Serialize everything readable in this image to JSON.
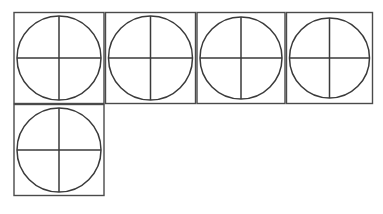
{
  "figure": {
    "title": "Quartered circles in squares",
    "background_color": "#ffffff",
    "square_stroke_color": "#4a4a4a",
    "circle_stroke_color": "#3a3a3a",
    "divider_stroke_color": "#3a3a3a",
    "stroke_width": 1.5,
    "shape_count": 5,
    "parts_per_shape": 4,
    "total_parts": 20,
    "rows": [
      {
        "row_label": "top-row",
        "cell_count": 4
      },
      {
        "row_label": "bottom-row",
        "cell_count": 1
      }
    ],
    "cells": [
      {
        "id": "cell-1",
        "label": "Quartered circle 1",
        "row": "top-row",
        "column": 1,
        "x": 14,
        "y": 12.5,
        "width": 90,
        "height": 91,
        "circle_cx": 59,
        "circle_cy": 58,
        "circle_r": 42
      },
      {
        "id": "cell-2",
        "label": "Quartered circle 2",
        "row": "top-row",
        "column": 2,
        "x": 105.5,
        "y": 12.5,
        "width": 90,
        "height": 91,
        "circle_cx": 150.5,
        "circle_cy": 58,
        "circle_r": 42
      },
      {
        "id": "cell-3",
        "label": "Quartered circle 3",
        "row": "top-row",
        "column": 3,
        "x": 197,
        "y": 12.5,
        "width": 88,
        "height": 91,
        "circle_cx": 241,
        "circle_cy": 58,
        "circle_r": 41
      },
      {
        "id": "cell-4",
        "label": "Quartered circle 4",
        "row": "top-row",
        "column": 4,
        "x": 286.5,
        "y": 12.5,
        "width": 86,
        "height": 91,
        "circle_cx": 329.5,
        "circle_cy": 58,
        "circle_r": 40
      },
      {
        "id": "cell-5",
        "label": "Quartered circle 5",
        "row": "bottom-row",
        "column": 1,
        "x": 14,
        "y": 104.5,
        "width": 90,
        "height": 91,
        "circle_cx": 59,
        "circle_cy": 150,
        "circle_r": 42
      }
    ]
  }
}
